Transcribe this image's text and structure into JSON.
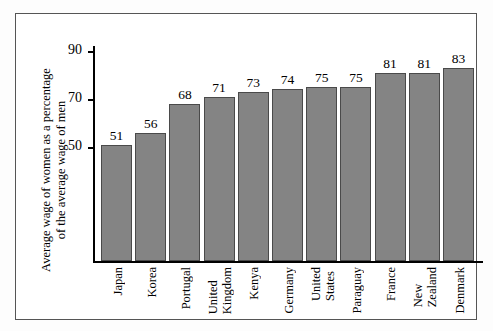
{
  "chart_data": {
    "type": "bar",
    "title": "",
    "subtitle": "",
    "xlabel": "",
    "ylabel": "Average wage of women as a percentage of the average wage of men",
    "ylabel_lines": [
      "Average wage of women as a percentage",
      "of the average wage of men"
    ],
    "categories": [
      "Japan",
      "Korea",
      "Portugal",
      "United Kingdom",
      "Kenya",
      "Germany",
      "United States",
      "Paraguay",
      "France",
      "New Zealand",
      "Denmark"
    ],
    "category_lines": [
      [
        "Japan"
      ],
      [
        "Korea"
      ],
      [
        "Portugal"
      ],
      [
        "United",
        "Kingdom"
      ],
      [
        "Kenya"
      ],
      [
        "Germany"
      ],
      [
        "United",
        "States"
      ],
      [
        "Paraguay"
      ],
      [
        "France"
      ],
      [
        "New",
        "Zealand"
      ],
      [
        "Denmark"
      ]
    ],
    "values": [
      51,
      56,
      68,
      71,
      73,
      74,
      75,
      75,
      81,
      81,
      83
    ],
    "value_labels": [
      "51",
      "56",
      "68",
      "71",
      "73",
      "74",
      "75",
      "75",
      "81",
      "81",
      "83"
    ],
    "yticks": [
      50,
      70,
      90
    ],
    "ytick_labels": [
      "50",
      "70",
      "90"
    ],
    "ylim": [
      3,
      92
    ],
    "grid": false,
    "legend": false,
    "bar_color": "#848484",
    "bar_edge_color": "#4a4a4a",
    "axis_color": "#000000",
    "frame_color": "#555555",
    "background_color": "#ffffff"
  }
}
